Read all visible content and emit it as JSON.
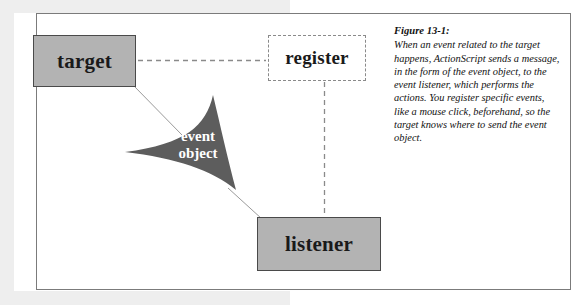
{
  "figure": {
    "caption_title": "Figure 13-1:",
    "caption_body": "When an event related to the target happens, ActionScript sends a message, in the form of the event object, to the event listener, which performs the actions. You register specific events, like a mouse click, beforehand, so the target knows where to send the event object."
  },
  "diagram": {
    "type": "flow-diagram",
    "nodes": [
      {
        "id": "target",
        "label": "target",
        "style": "solid-gray-box"
      },
      {
        "id": "register",
        "label": "register",
        "style": "dashed-box"
      },
      {
        "id": "listener",
        "label": "listener",
        "style": "solid-gray-box"
      },
      {
        "id": "event-object",
        "label_line1": "event",
        "label_line2": "object",
        "style": "dark-arrow-shape"
      }
    ],
    "connectors": [
      {
        "from": "target",
        "to": "register",
        "style": "dashed-horizontal"
      },
      {
        "from": "register",
        "to": "listener",
        "style": "dashed-vertical"
      },
      {
        "from": "target",
        "to": "event-object",
        "style": "thin-solid-line"
      },
      {
        "from": "event-object",
        "to": "listener",
        "style": "thin-solid-line"
      }
    ]
  },
  "colors": {
    "box_fill": "#b3b3b3",
    "box_border": "#4a4a4a",
    "dashed_border": "#8a8a8a",
    "arrow_fill": "#5d5d5d",
    "frame_border": "#7b7b7b",
    "gutter": "#eeeeee",
    "text": "#1a1a1a",
    "arrow_text": "#ffffff"
  }
}
